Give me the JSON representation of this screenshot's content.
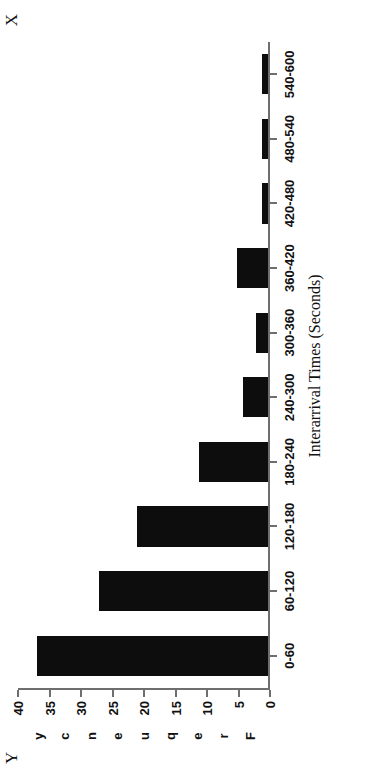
{
  "figure": {
    "x_axis_name": "X",
    "y_axis_name": "Y",
    "y_axis_word_letters": [
      "F",
      "r",
      "e",
      "q",
      "u",
      "e",
      "n",
      "c",
      "y"
    ]
  },
  "chart_data": {
    "type": "bar",
    "title": "",
    "subtitle": "",
    "xlabel": "Interarrival Times (Seconds)",
    "ylabel": "Frequency",
    "orientation": "vertical-rotated-90ccw",
    "categories": [
      "0-60",
      "60-120",
      "120-180",
      "180-240",
      "240-300",
      "300-360",
      "360-420",
      "420-480",
      "480-540",
      "540-600"
    ],
    "values": [
      37,
      27,
      21,
      11,
      4,
      2,
      5,
      1,
      1,
      1
    ],
    "ylim": [
      0,
      40
    ],
    "yticks": [
      0,
      5,
      10,
      15,
      20,
      25,
      30,
      35,
      40
    ],
    "ytick_labels": [
      "0",
      "5",
      "10",
      "15",
      "20",
      "25",
      "30",
      "35",
      "40"
    ],
    "grid": false,
    "legend": false,
    "bar_color": "#0d0d0d",
    "axis_color": "#6e6e6e"
  }
}
